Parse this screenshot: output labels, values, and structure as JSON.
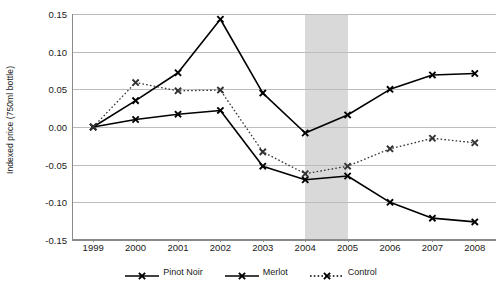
{
  "chart_data": {
    "type": "line",
    "title": "",
    "xlabel": "",
    "ylabel": "Indexed price (750ml bottle)",
    "categories": [
      "1999",
      "2000",
      "2001",
      "2002",
      "2003",
      "2004",
      "2005",
      "2006",
      "2007",
      "2008"
    ],
    "ylim": [
      -0.15,
      0.15
    ],
    "yticks": [
      "0.15",
      "0.10",
      "0.05",
      "0.00",
      "-0.05",
      "-0.10",
      "-0.15"
    ],
    "ytick_values": [
      0.15,
      0.1,
      0.05,
      0.0,
      -0.05,
      -0.1,
      -0.15
    ],
    "grid": true,
    "legend_position": "bottom",
    "series": [
      {
        "name": "Pinot Noir",
        "style": "solid",
        "color": "#000000",
        "marker": "x",
        "values": [
          0.0,
          0.035,
          0.072,
          0.143,
          0.045,
          -0.008,
          0.016,
          0.05,
          0.069,
          0.071
        ]
      },
      {
        "name": "Merlot",
        "style": "solid",
        "color": "#000000",
        "marker": "x",
        "values": [
          0.0,
          0.01,
          0.017,
          0.022,
          -0.052,
          -0.07,
          -0.065,
          -0.1,
          -0.121,
          -0.126
        ]
      },
      {
        "name": "Control",
        "style": "dotted",
        "color": "#333333",
        "marker": "x",
        "values": [
          0.0,
          0.059,
          0.048,
          0.049,
          -0.033,
          -0.062,
          -0.052,
          -0.029,
          -0.015,
          -0.021
        ]
      }
    ],
    "annotations": [
      {
        "type": "shaded-band",
        "label": "highlight-band-2004-2005",
        "from": "2004",
        "to": "2005",
        "color": "#d9d9d9"
      }
    ]
  },
  "legend": {
    "items": [
      {
        "label": "Pinot Noir",
        "style": "solid"
      },
      {
        "label": "Merlot",
        "style": "solid"
      },
      {
        "label": "Control",
        "style": "dotted"
      }
    ]
  }
}
